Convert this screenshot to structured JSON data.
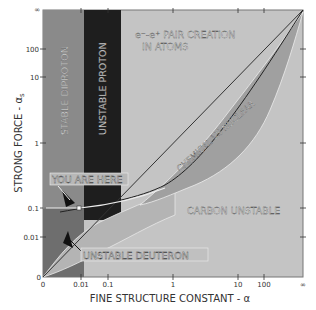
{
  "figure": {
    "y_axis": {
      "label": "STRONG FORCE - αs",
      "label_main": "STRONG FORCE - α",
      "label_sub": "s",
      "ticks": [
        "∞",
        "100",
        "10",
        "1",
        "0.1",
        "0.01",
        "0"
      ]
    },
    "x_axis": {
      "label": "FINE STRUCTURE CONSTANT - α",
      "ticks": [
        "0",
        "0.01",
        "0.1",
        "1",
        "10",
        "100",
        "∞"
      ]
    },
    "regions": {
      "stable_diproton": "STABLE DIPROTON",
      "unstable_proton": "UNSTABLE PROTON",
      "pair_creation_line1": "e⁻-e⁺ PAIR CREATION",
      "pair_creation_line2": "IN ATOMS",
      "chemical_vs_nuclear": "CHEMICAL VS NUCLEAR",
      "carbon_unstable": "CARBON UNSTABLE",
      "unstable_deuteron": "UNSTABLE DEUTERON"
    },
    "annotations": {
      "you_are_here": "YOU ARE HERE"
    },
    "colors": {
      "background_region": "#c4c4c4",
      "stable_diproton": "#8c8c8c",
      "unstable_proton": "#1e1e1e",
      "chemical_band": "#a3a3a3",
      "deuteron_band": "#b0b0b0",
      "axis": "#555555"
    }
  }
}
